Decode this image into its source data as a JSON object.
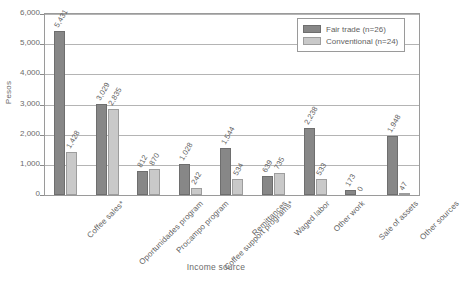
{
  "chart_data": {
    "type": "bar",
    "title": "",
    "xlabel": "Income source",
    "ylabel": "Pesos",
    "ylim": [
      0,
      6000
    ],
    "ytick_labels": [
      "0",
      "1,000",
      "2,000",
      "3,000",
      "4,000",
      "5,000",
      "6,000"
    ],
    "ytick_values": [
      0,
      1000,
      2000,
      3000,
      4000,
      5000,
      6000
    ],
    "grid": true,
    "legend_position": "top-right",
    "categories": [
      "Coffee sales*",
      "Oportunidades program",
      "Procampo program",
      "Coffee support programs*",
      "Remittances",
      "Waged labor",
      "Other work",
      "Sale of assets",
      "Other sources"
    ],
    "series": [
      {
        "name": "Fair trade (n=26)",
        "color": "#878787",
        "values": [
          5431,
          3029,
          812,
          1028,
          1544,
          639,
          2238,
          173,
          1948
        ],
        "labels": [
          "5,431",
          "3,029",
          "812",
          "1,028",
          "1,544",
          "639",
          "2,238",
          "173",
          "1,948"
        ]
      },
      {
        "name": "Conventional (n=24)",
        "color": "#c9c9c9",
        "values": [
          1428,
          2835,
          870,
          242,
          534,
          735,
          533,
          0,
          47
        ],
        "labels": [
          "1,428",
          "2,835",
          "870",
          "242",
          "534",
          "735",
          "533",
          "0",
          "47"
        ]
      }
    ]
  },
  "legend": {
    "items": [
      {
        "label": "Fair trade (n=26)",
        "color": "#878787"
      },
      {
        "label": "Conventional (n=24)",
        "color": "#c9c9c9"
      }
    ]
  },
  "caption": {
    "text": ""
  }
}
